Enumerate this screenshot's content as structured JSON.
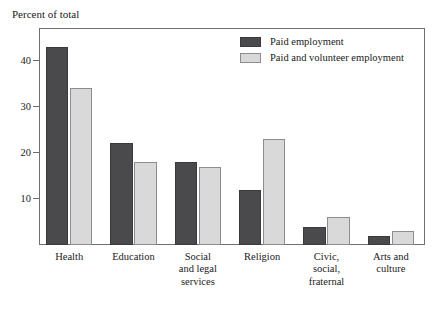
{
  "chart_data": {
    "type": "bar",
    "title": "Percent of total",
    "xlabel": "",
    "ylabel": "Percent of total",
    "ylim": [
      0,
      47
    ],
    "yticks": [
      10,
      20,
      30,
      40
    ],
    "grid": false,
    "legend_position": "top-right",
    "categories": [
      "Health",
      "Education",
      "Social\nand legal\nservices",
      "Religion",
      "Civic,\nsocial,\nfraternal",
      "Arts and\nculture"
    ],
    "series": [
      {
        "name": "Paid employment",
        "color": "#4a4a4c",
        "values": [
          42.8,
          22,
          18,
          12,
          4,
          2
        ]
      },
      {
        "name": "Paid and volunteer employment",
        "color": "#d9d9d9",
        "values": [
          34,
          18,
          17,
          23,
          6,
          3
        ]
      }
    ]
  },
  "legend": {
    "items": [
      {
        "label": "Paid employment",
        "swatch": "dark"
      },
      {
        "label": "Paid and volunteer employment",
        "swatch": "light"
      }
    ]
  }
}
